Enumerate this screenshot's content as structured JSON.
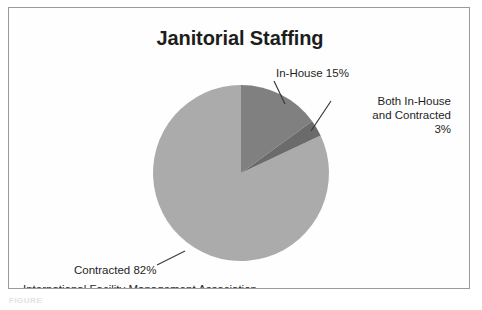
{
  "chart_data": {
    "type": "pie",
    "title": "Janitorial Staffing",
    "source": "International Facility Management Association",
    "categories": [
      "In-House",
      "Both In-House and Contracted",
      "Contracted"
    ],
    "values": [
      15,
      3,
      82
    ],
    "value_unit": "%",
    "labels": [
      "In-House 15%",
      "Both In-House and Contracted 3%",
      "Contracted 82%"
    ],
    "colors": [
      "#808080",
      "#6b6b6b",
      "#ababab"
    ],
    "legend": "none",
    "grid": false,
    "start_angle_deg": 0,
    "direction": "clockwise",
    "xlabel": "",
    "ylabel": ""
  },
  "chart": {
    "title": "Janitorial Staffing",
    "labels": {
      "in_house": "In-House 15%",
      "both_line1": "Both In-House",
      "both_line2": "and Contracted",
      "both_line3": "3%",
      "contracted": "Contracted 82%"
    },
    "source": "International Facility Management Association"
  },
  "caption": {
    "text": "FIGURE"
  }
}
